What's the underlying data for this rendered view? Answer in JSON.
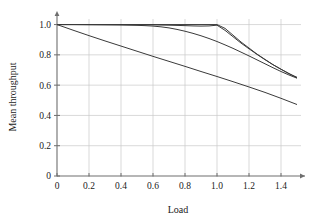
{
  "chart_data": {
    "type": "line",
    "title": "",
    "xlabel": "Load",
    "ylabel": "Mean throughput",
    "xlim": [
      0,
      1.55
    ],
    "ylim": [
      0,
      1.05
    ],
    "grid": true,
    "legend": "none",
    "xticks": [
      "0",
      "0.2",
      "0.4",
      "0.6",
      "0.8",
      "1.0",
      "1.2",
      "1.4"
    ],
    "xtick_values": [
      0,
      0.2,
      0.4,
      0.6,
      0.8,
      1.0,
      1.2,
      1.4
    ],
    "yticks": [
      "0",
      "0.2",
      "0.4",
      "0.6",
      "0.8",
      "1.0"
    ],
    "ytick_values": [
      0,
      0.2,
      0.4,
      0.6,
      0.8,
      1.0
    ],
    "series": [
      {
        "name": "curve-1",
        "x": [
          0.0,
          0.1,
          0.2,
          0.3,
          0.4,
          0.5,
          0.6,
          0.7,
          0.8,
          0.9,
          0.95,
          1.0,
          1.05,
          1.1,
          1.15,
          1.2,
          1.25,
          1.3,
          1.35,
          1.4,
          1.45,
          1.5
        ],
        "y": [
          1.0,
          1.0,
          1.0,
          1.0,
          1.0,
          1.0,
          1.0,
          1.0,
          1.0,
          1.0,
          1.0,
          1.0,
          0.975,
          0.93,
          0.885,
          0.845,
          0.805,
          0.77,
          0.735,
          0.705,
          0.675,
          0.652
        ]
      },
      {
        "name": "curve-2",
        "x": [
          0.0,
          0.1,
          0.2,
          0.3,
          0.4,
          0.5,
          0.6,
          0.7,
          0.8,
          0.85,
          0.9,
          0.95,
          1.0,
          1.05,
          1.1,
          1.15,
          1.2,
          1.25,
          1.3,
          1.35,
          1.4,
          1.45,
          1.5
        ],
        "y": [
          1.0,
          1.0,
          1.0,
          1.0,
          1.0,
          0.999,
          0.998,
          0.996,
          0.993,
          0.991,
          0.99,
          0.991,
          0.996,
          0.962,
          0.92,
          0.878,
          0.84,
          0.803,
          0.768,
          0.735,
          0.705,
          0.677,
          0.648
        ]
      },
      {
        "name": "curve-3",
        "x": [
          0.0,
          0.1,
          0.2,
          0.3,
          0.4,
          0.5,
          0.55,
          0.6,
          0.65,
          0.7,
          0.75,
          0.8,
          0.85,
          0.9,
          0.95,
          1.0,
          1.05,
          1.1,
          1.15,
          1.2,
          1.25,
          1.3,
          1.35,
          1.4,
          1.45,
          1.5
        ],
        "y": [
          1.0,
          1.0,
          0.999,
          0.998,
          0.997,
          0.995,
          0.993,
          0.99,
          0.985,
          0.978,
          0.968,
          0.956,
          0.942,
          0.926,
          0.908,
          0.888,
          0.866,
          0.843,
          0.818,
          0.793,
          0.767,
          0.741,
          0.715,
          0.69,
          0.667,
          0.646
        ]
      },
      {
        "name": "curve-4",
        "x": [
          0.0,
          0.1,
          0.2,
          0.3,
          0.4,
          0.5,
          0.6,
          0.7,
          0.8,
          0.9,
          1.0,
          1.1,
          1.2,
          1.3,
          1.4,
          1.5
        ],
        "y": [
          1.0,
          0.963,
          0.927,
          0.892,
          0.858,
          0.824,
          0.79,
          0.757,
          0.724,
          0.69,
          0.657,
          0.623,
          0.588,
          0.552,
          0.513,
          0.472
        ]
      }
    ]
  },
  "axes": {
    "x_label": "Load",
    "y_label": "Mean throughput"
  },
  "colors": {
    "curve": "#3a3a3a",
    "grid": "#c8c8c8",
    "axis": "#6e6e6e",
    "text": "#1a1a1a",
    "background": "#ffffff"
  }
}
